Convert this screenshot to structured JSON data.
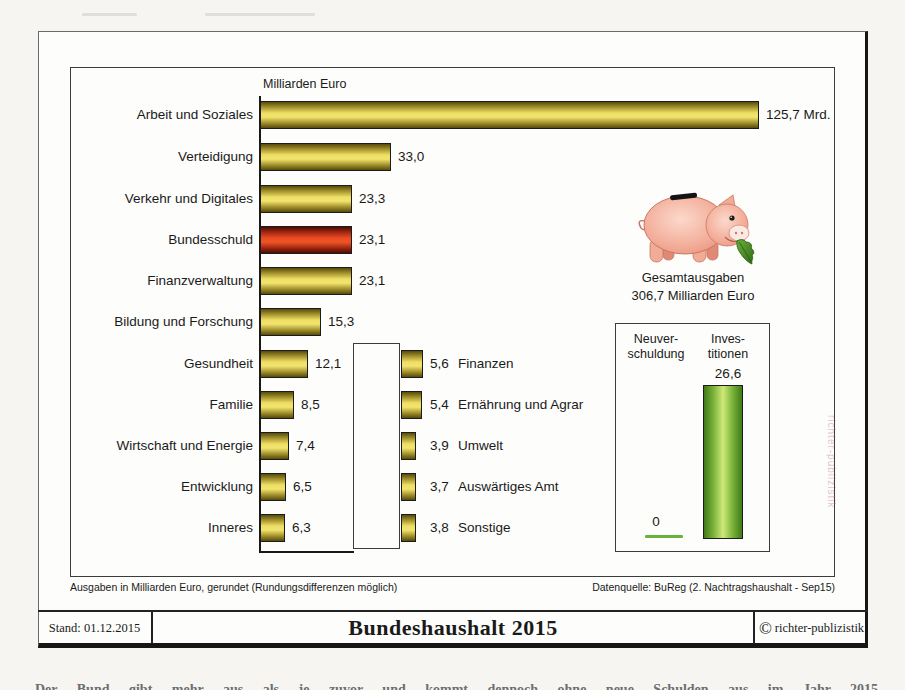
{
  "chart": {
    "axis_title": "Milliarden Euro",
    "main_bars": [
      {
        "label": "Arbeit und Soziales",
        "value": 125.7,
        "value_label": "125,7 Mrd.",
        "highlight": false
      },
      {
        "label": "Verteidigung",
        "value": 33.0,
        "value_label": "33,0",
        "highlight": false
      },
      {
        "label": "Verkehr und Digitales",
        "value": 23.3,
        "value_label": "23,3",
        "highlight": false
      },
      {
        "label": "Bundesschuld",
        "value": 23.1,
        "value_label": "23,1",
        "highlight": true
      },
      {
        "label": "Finanzverwaltung",
        "value": 23.1,
        "value_label": "23,1",
        "highlight": false
      },
      {
        "label": "Bildung und Forschung",
        "value": 15.3,
        "value_label": "15,3",
        "highlight": false
      },
      {
        "label": "Gesundheit",
        "value": 12.1,
        "value_label": "12,1",
        "highlight": false
      },
      {
        "label": "Familie",
        "value": 8.5,
        "value_label": "8,5",
        "highlight": false
      },
      {
        "label": "Wirtschaft und Energie",
        "value": 7.4,
        "value_label": "7,4",
        "highlight": false
      },
      {
        "label": "Entwicklung",
        "value": 6.5,
        "value_label": "6,5",
        "highlight": false
      },
      {
        "label": "Inneres",
        "value": 6.3,
        "value_label": "6,3",
        "highlight": false
      }
    ],
    "sub_bars": [
      {
        "value_label": "5,6",
        "label": "Finanzen",
        "value": 5.6
      },
      {
        "value_label": "5,4",
        "label": "Ernährung und Agrar",
        "value": 5.4
      },
      {
        "value_label": "3,9",
        "label": "Umwelt",
        "value": 3.9
      },
      {
        "value_label": "3,7",
        "label": "Auswärtiges Amt",
        "value": 3.7
      },
      {
        "value_label": "3,8",
        "label": "Sonstige",
        "value": 3.8
      }
    ],
    "total_caption": {
      "line1": "Gesamtausgaben",
      "line2": "306,7 Milliarden Euro"
    },
    "inset": {
      "left_label_line1": "Neuver-",
      "left_label_line2": "schuldung",
      "right_label_line1": "Inves-",
      "right_label_line2": "titionen",
      "right_value": 26.6,
      "right_value_label": "26,6",
      "left_value": 0,
      "left_value_label": "0"
    },
    "watermark": "richter-publizistik"
  },
  "footnotes": {
    "left": "Ausgaben in Milliarden Euro, gerundet (Rundungsdifferenzen möglich)",
    "right": "Datenquelle: BuReg (2. Nachtragshaushalt - Sep15)"
  },
  "titlebar": {
    "stand": "Stand: 01.12.2015",
    "title": "Bundeshaushalt 2015",
    "credit_symbol": "©",
    "credit_name": "richter-publizistik"
  },
  "artifacts": {
    "cropped_caption_fragment": "Der Bund gibt mehr aus als je zuvor und kommt dennoch ohne neue Schulden aus im Jahr 2015"
  },
  "colors": {
    "bar_gold_mid": "#eedd64",
    "bar_gold_dark": "#564a0e",
    "bar_red_mid": "#e94b21",
    "bar_red_dark": "#490d02",
    "bar_green_mid": "#cfe87a",
    "bar_green_dark": "#3f7a18",
    "pig_pink": "#f2b3a0",
    "leaf_green": "#3e8a1e",
    "watermark_pink": "#ba6c82"
  },
  "chart_data": {
    "type": "bar",
    "orientation": "horizontal",
    "title": "Bundeshaushalt 2015",
    "unit_label": "Milliarden Euro",
    "categories": [
      "Arbeit und Soziales",
      "Verteidigung",
      "Verkehr und Digitales",
      "Bundesschuld",
      "Finanzverwaltung",
      "Bildung und Forschung",
      "Gesundheit",
      "Familie",
      "Wirtschaft und Energie",
      "Entwicklung",
      "Inneres",
      "Finanzen",
      "Ernährung und Agrar",
      "Umwelt",
      "Auswärtiges Amt",
      "Sonstige"
    ],
    "values": [
      125.7,
      33.0,
      23.3,
      23.1,
      23.1,
      15.3,
      12.1,
      8.5,
      7.4,
      6.5,
      6.3,
      5.6,
      5.4,
      3.9,
      3.7,
      3.8
    ],
    "highlighted_category": "Bundesschuld",
    "total_label": "Gesamtausgaben",
    "total_value": 306.7,
    "inset_chart": {
      "type": "bar",
      "orientation": "vertical",
      "categories": [
        "Neuverschuldung",
        "Investitionen"
      ],
      "values": [
        0,
        26.6
      ]
    },
    "source": "Datenquelle: BuReg (2. Nachtragshaushalt - Sep15)",
    "note": "Ausgaben in Milliarden Euro, gerundet (Rundungsdifferenzen möglich)",
    "date_of_data": "Stand: 01.12.2015"
  }
}
